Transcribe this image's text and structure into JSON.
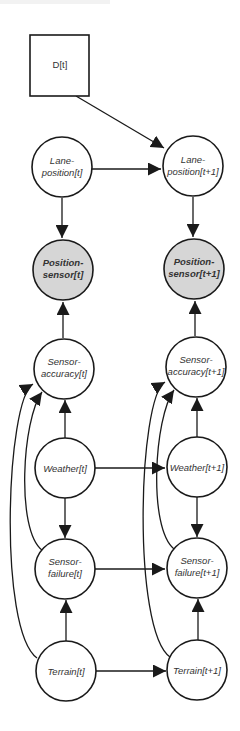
{
  "diagram": {
    "type": "dynamic-bayesian-network",
    "colors": {
      "node_fill": "#ffffff",
      "observed_fill": "#d6d6d6",
      "stroke": "#1a1a1a",
      "text": "#333333"
    },
    "nodes": {
      "d_t": {
        "line1": "D[t]",
        "line2": ""
      },
      "lane_t": {
        "line1": "Lane-",
        "line2": "position[t]"
      },
      "lane_t1": {
        "line1": "Lane-",
        "line2": "position[t+1]"
      },
      "pos_t": {
        "line1": "Position-",
        "line2": "sensor[t]"
      },
      "pos_t1": {
        "line1": "Position-",
        "line2": "sensor[t+1]"
      },
      "acc_t": {
        "line1": "Sensor-",
        "line2": "accuracy[t]"
      },
      "acc_t1": {
        "line1": "Sensor-",
        "line2": "accuracy[t+1]"
      },
      "weather_t": {
        "line1": "Weather[t]",
        "line2": ""
      },
      "weather_t1": {
        "line1": "Weather[t+1]",
        "line2": ""
      },
      "fail_t": {
        "line1": "Sensor-",
        "line2": "failure[t]"
      },
      "fail_t1": {
        "line1": "Sensor-",
        "line2": "failure[t+1]"
      },
      "terrain_t": {
        "line1": "Terrain[t]",
        "line2": ""
      },
      "terrain_t1": {
        "line1": "Terrain[t+1]",
        "line2": ""
      }
    },
    "edges": [
      [
        "D[t]",
        "Lane-position[t+1]"
      ],
      [
        "Lane-position[t]",
        "Lane-position[t+1]"
      ],
      [
        "Lane-position[t]",
        "Position-sensor[t]"
      ],
      [
        "Lane-position[t+1]",
        "Position-sensor[t+1]"
      ],
      [
        "Sensor-accuracy[t]",
        "Position-sensor[t]"
      ],
      [
        "Sensor-accuracy[t+1]",
        "Position-sensor[t+1]"
      ],
      [
        "Weather[t]",
        "Sensor-accuracy[t]"
      ],
      [
        "Weather[t+1]",
        "Sensor-accuracy[t+1]"
      ],
      [
        "Weather[t]",
        "Weather[t+1]"
      ],
      [
        "Weather[t]",
        "Sensor-failure[t]"
      ],
      [
        "Weather[t+1]",
        "Sensor-failure[t+1]"
      ],
      [
        "Sensor-failure[t]",
        "Sensor-failure[t+1]"
      ],
      [
        "Sensor-failure[t]",
        "Sensor-accuracy[t]"
      ],
      [
        "Sensor-failure[t+1]",
        "Sensor-accuracy[t+1]"
      ],
      [
        "Terrain[t]",
        "Sensor-failure[t]"
      ],
      [
        "Terrain[t+1]",
        "Sensor-failure[t+1]"
      ],
      [
        "Terrain[t]",
        "Sensor-accuracy[t]"
      ],
      [
        "Terrain[t+1]",
        "Sensor-accuracy[t+1]"
      ],
      [
        "Terrain[t]",
        "Terrain[t+1]"
      ]
    ]
  }
}
